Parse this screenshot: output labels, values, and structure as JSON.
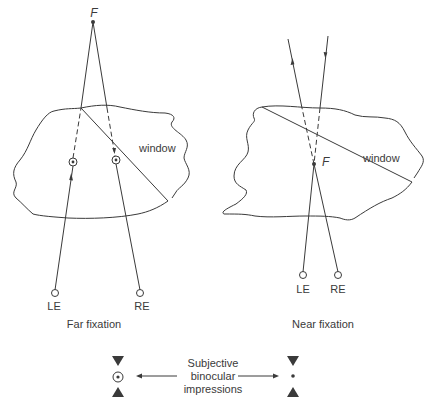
{
  "panels": {
    "far": {
      "caption": "Far fixation",
      "fixation_label": "F",
      "window_label": "window",
      "left_eye_label": "LE",
      "right_eye_label": "RE"
    },
    "near": {
      "caption": "Near fixation",
      "fixation_label": "F",
      "window_label": "window",
      "left_eye_label": "LE",
      "right_eye_label": "RE"
    }
  },
  "legend": {
    "text_line1": "Subjective",
    "text_line2": "binocular",
    "text_line3": "impressions",
    "left_symbol": "circled-dot-between-triangles",
    "right_symbol": "dot-between-triangles"
  },
  "colors": {
    "stroke": "#3a3a3a",
    "background": "#ffffff"
  }
}
